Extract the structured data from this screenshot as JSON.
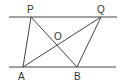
{
  "diagram": {
    "type": "geometry",
    "parallel_lines": [
      {
        "name": "top-line",
        "x1": 9,
        "y1": 17,
        "x2": 117,
        "y2": 17
      },
      {
        "name": "bottom-line",
        "x1": 9,
        "y1": 67,
        "x2": 116,
        "y2": 67
      }
    ],
    "points": {
      "P": {
        "label": "P",
        "x": 31,
        "y": 17,
        "lx": 30,
        "ly": 13
      },
      "Q": {
        "label": "Q",
        "x": 101,
        "y": 17,
        "lx": 101,
        "ly": 13
      },
      "A": {
        "label": "A",
        "x": 23,
        "y": 67,
        "lx": 22,
        "ly": 79
      },
      "B": {
        "label": "B",
        "x": 77,
        "y": 67,
        "lx": 77,
        "ly": 79
      },
      "O": {
        "label": "O",
        "x": 57,
        "y": 42,
        "lx": 58,
        "ly": 39
      }
    },
    "segments": [
      {
        "name": "segment-PA",
        "from": "P",
        "to": "A"
      },
      {
        "name": "segment-PB",
        "from": "P",
        "to": "B"
      },
      {
        "name": "segment-AQ",
        "from": "A",
        "to": "Q"
      },
      {
        "name": "segment-QB",
        "from": "Q",
        "to": "B"
      }
    ],
    "line_color": "#444444",
    "label_color": "#333333"
  }
}
